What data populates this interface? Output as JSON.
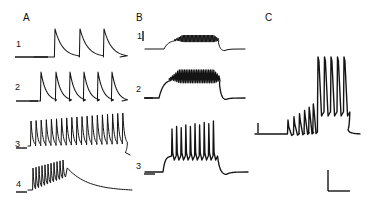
{
  "figure": {
    "title": "",
    "background_color": "#ffffff",
    "trace_color": "#141414",
    "width": 378,
    "height": 211
  },
  "panels": [
    {
      "letter": "A",
      "letter_pos": {
        "x": 23,
        "y": 13
      },
      "traces": [
        {
          "label": "1",
          "label_pos": {
            "x": 16,
            "y": 40
          }
        },
        {
          "label": "2",
          "label_pos": {
            "x": 15,
            "y": 83
          }
        },
        {
          "label": "3",
          "label_pos": {
            "x": 15,
            "y": 140
          }
        },
        {
          "label": "4",
          "label_pos": {
            "x": 16,
            "y": 180
          }
        }
      ]
    },
    {
      "letter": "B",
      "letter_pos": {
        "x": 136,
        "y": 13
      },
      "traces": [
        {
          "label": "1",
          "label_pos": {
            "x": 138,
            "y": 33
          }
        },
        {
          "label": "2",
          "label_pos": {
            "x": 136,
            "y": 85
          }
        },
        {
          "label": "3",
          "label_pos": {
            "x": 136,
            "y": 162
          }
        }
      ]
    },
    {
      "letter": "C",
      "letter_pos": {
        "x": 265,
        "y": 13
      },
      "traces": [
        {
          "label": "",
          "label_pos": {
            "x": 0,
            "y": 0
          }
        }
      ]
    }
  ],
  "chart_data": {
    "type": "line",
    "title": "",
    "xlabel": "",
    "ylabel": "",
    "grid": false,
    "legend": null,
    "panels": [
      {
        "id": "A1",
        "baseline_y": 57,
        "x_start": 34,
        "x_end": 120,
        "events": [
          {
            "type": "spike-decay",
            "x": 55,
            "peak_y": 29,
            "decay_tau": 9
          },
          {
            "type": "spike-decay",
            "x": 80,
            "peak_y": 29,
            "decay_tau": 9
          },
          {
            "type": "spike-decay",
            "x": 104,
            "peak_y": 29,
            "decay_tau": 9
          }
        ],
        "spike_count": 3,
        "notes": "three well-separated slow events with fast rise and exponential decay; flat scale-bar baseline at left"
      },
      {
        "id": "A2",
        "baseline_y": 101,
        "x_start": 30,
        "x_end": 122,
        "events": [
          {
            "type": "spike-decay",
            "x": 41,
            "peak_y": 72,
            "decay_tau": 6
          },
          {
            "type": "spike-decay",
            "x": 56,
            "peak_y": 72,
            "decay_tau": 6
          },
          {
            "type": "spike-decay",
            "x": 70,
            "peak_y": 72,
            "decay_tau": 6
          },
          {
            "type": "spike-decay",
            "x": 84,
            "peak_y": 72,
            "decay_tau": 6
          },
          {
            "type": "spike-decay",
            "x": 98,
            "peak_y": 72,
            "decay_tau": 6
          },
          {
            "type": "spike-decay",
            "x": 112,
            "peak_y": 72,
            "decay_tau": 6
          }
        ],
        "spike_count": 6,
        "notes": "six events at higher frequency than A1"
      },
      {
        "id": "A3",
        "baseline_y": 146,
        "x_start": 28,
        "x_end": 130,
        "spike_count": 19,
        "first_spike_x": 31,
        "spike_interval": 5.1,
        "peak_y_first": 121,
        "peak_y_last": 113,
        "offset_x": 125,
        "notes": "dense train of ~19 spikes with slowly rising envelope, then repolarising tail"
      },
      {
        "id": "A4",
        "baseline_y": 190,
        "x_start": 28,
        "x_end": 132,
        "spike_count": 11,
        "first_spike_x": 33,
        "spike_interval": 3.0,
        "peak_y_first": 168,
        "peak_y_last": 160,
        "burst_end_x": 64,
        "notes": "brief dense burst then long slow exponential decay to baseline"
      },
      {
        "id": "B1",
        "baseline_y": 49,
        "x_start": 145,
        "x_end": 245,
        "plateau_start_x": 168,
        "plateau_end_x": 218,
        "plateau_y": 40,
        "oscillation_count": 34,
        "oscillation_amplitude": 5,
        "notes": "small plateau depolarization with dense low-amplitude oscillations"
      },
      {
        "id": "B2",
        "baseline_y": 98,
        "x_start": 145,
        "x_end": 245,
        "plateau_start_x": 163,
        "plateau_end_x": 219,
        "plateau_y": 79,
        "oscillation_count": 30,
        "oscillation_amplitude": 9,
        "notes": "larger plateau with thicker band of spikes on top; sharp repolarization"
      },
      {
        "id": "B3",
        "baseline_y": 172,
        "x_start": 145,
        "x_end": 248,
        "plateau_start_x": 167,
        "plateau_end_x": 213,
        "plateau_y": 156,
        "spike_count": 10,
        "first_spike_x": 172,
        "spike_interval": 4.6,
        "peak_y_tall": 121,
        "notes": "ten full-amplitude spikes riding on a depolarizing plateau"
      },
      {
        "id": "C",
        "baseline_y": 134,
        "x_start": 255,
        "x_end": 360,
        "small_spike_count": 6,
        "small_first_x": 288,
        "small_interval": 6.2,
        "small_peak_y_first": 120,
        "small_peak_y_last": 104,
        "tall_spike_count": 5,
        "tall_first_x": 318,
        "tall_interval": 6.5,
        "tall_peak_y": 57,
        "plateau_end_x": 348,
        "notes": "accelerating small spikes ramp into a burst of five tall spikes then repolarization"
      }
    ],
    "scale_bars": [
      {
        "id": "scale-a1",
        "type": "horizontal",
        "x": 15,
        "y": 57,
        "length": 33
      },
      {
        "id": "scale-a2",
        "type": "horizontal",
        "x": 16,
        "y": 101,
        "length": 22
      },
      {
        "id": "scale-a3",
        "type": "horizontal",
        "x": 16,
        "y": 148,
        "length": 11
      },
      {
        "id": "scale-a4",
        "type": "horizontal",
        "x": 16,
        "y": 192,
        "length": 11
      },
      {
        "id": "scale-b1",
        "type": "vertical",
        "x": 143,
        "y": 31,
        "length": 10
      },
      {
        "id": "scale-b2",
        "type": "horizontal",
        "x": 144,
        "y": 98,
        "length": 9
      },
      {
        "id": "scale-b3",
        "type": "horizontal",
        "x": 144,
        "y": 174,
        "length": 11
      },
      {
        "id": "scale-c-vertical",
        "type": "vertical",
        "x": 258,
        "y": 123,
        "length": 10
      },
      {
        "id": "scale-c-corner-vertical",
        "type": "vertical",
        "x": 328,
        "y": 170,
        "length": 21
      },
      {
        "id": "scale-c-corner-horizontal",
        "type": "horizontal",
        "x": 328,
        "y": 191,
        "length": 22
      }
    ]
  }
}
